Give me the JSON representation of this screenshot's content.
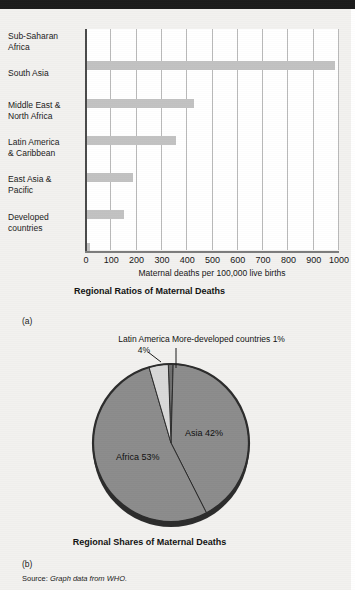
{
  "page": {
    "source_label": "Source:",
    "source_body": "Graph data from WHO.",
    "panel_a_letter": "(a)",
    "panel_b_letter": "(b)"
  },
  "chart_data": [
    {
      "type": "bar",
      "orientation": "horizontal",
      "title": "Regional Ratios of Maternal Deaths",
      "xlabel": "Maternal deaths per 100,000 live births",
      "ylabel": "",
      "xlim": [
        0,
        1000
      ],
      "xticks": [
        0,
        100,
        200,
        300,
        400,
        500,
        600,
        700,
        800,
        900,
        1000
      ],
      "xtick_labels": [
        "0",
        "100",
        "200",
        "300",
        "400",
        "500",
        "600",
        "700",
        "800",
        "900",
        "1000"
      ],
      "grid": true,
      "legend": "none",
      "bar_color": "#c2c2c2",
      "categories": [
        "Sub-Saharan Africa",
        "South Asia",
        "Middle East & North Africa",
        "Latin America & Caribbean",
        "East Asia & Pacific",
        "Developed countries"
      ],
      "category_lines": [
        [
          "Sub-Saharan",
          "Africa"
        ],
        [
          "South Asia"
        ],
        [
          "Middle East &",
          "North Africa"
        ],
        [
          "Latin America",
          "& Caribbean"
        ],
        [
          "East Asia &",
          "Pacific"
        ],
        [
          "Developed",
          "countries"
        ]
      ],
      "values": [
        990,
        430,
        360,
        190,
        155,
        21
      ]
    },
    {
      "type": "pie",
      "title": "Regional Shares of Maternal Deaths",
      "legend": "callouts",
      "slices": [
        {
          "label": "Africa 53%",
          "name": "Africa",
          "value": 53,
          "color": "#8c8c8c",
          "placement": "inside"
        },
        {
          "label": "Asia 42%",
          "name": "Asia",
          "value": 42,
          "color": "#8c8c8c",
          "placement": "inside"
        },
        {
          "label": "Latin America 4%",
          "name": "Latin America",
          "value": 4,
          "color": "#d8d8d8",
          "placement": "callout"
        },
        {
          "label": "More-developed countries 1%",
          "name": "More-developed countries",
          "value": 1,
          "color": "#6e6e6e",
          "placement": "callout"
        }
      ],
      "callouts": {
        "latin_america": "Latin America\n4%",
        "latin_america_line1": "Latin America",
        "latin_america_line2": "4%",
        "more_developed": "More-developed countries 1%"
      },
      "inner_labels": {
        "asia": "Asia 42%",
        "africa": "Africa 53%"
      }
    }
  ]
}
